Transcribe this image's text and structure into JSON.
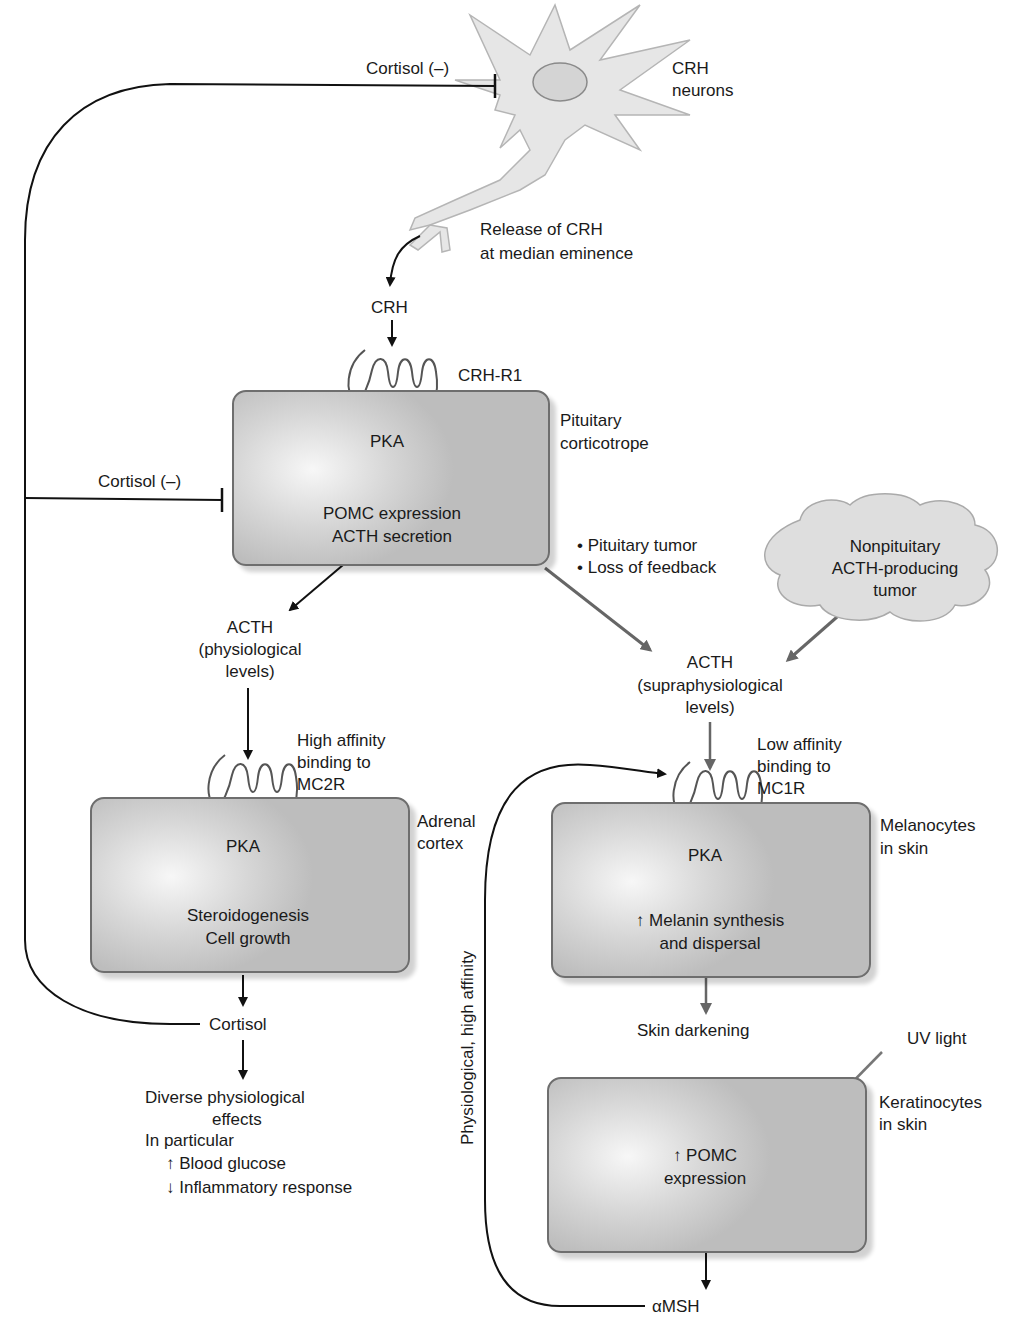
{
  "neuron": {
    "label_line1": "CRH",
    "label_line2": "neurons",
    "release_line1": "Release of CRH",
    "release_line2": "at median eminence"
  },
  "feedback": {
    "top_label": "Cortisol (–)",
    "mid_label": "Cortisol (–)"
  },
  "crh": {
    "label": "CRH",
    "receptor": "CRH-R1"
  },
  "pituitary": {
    "name_line1": "Pituitary",
    "name_line2": "corticotrope",
    "pka": "PKA",
    "line1": "POMC expression",
    "line2": "ACTH secretion"
  },
  "pathology": {
    "bullet1": "• Pituitary tumor",
    "bullet2": "• Loss of feedback"
  },
  "tumor_cloud": {
    "line1": "Nonpituitary",
    "line2": "ACTH-producing",
    "line3": "tumor"
  },
  "acth_phys": {
    "line1": "ACTH",
    "line2": "(physiological",
    "line3": "levels)"
  },
  "acth_supra": {
    "line1": "ACTH",
    "line2": "(supraphysiological",
    "line3": "levels)"
  },
  "adrenal": {
    "binding_line1": "High affinity",
    "binding_line2": "binding to",
    "binding_line3": "MC2R",
    "name_line1": "Adrenal",
    "name_line2": "cortex",
    "pka": "PKA",
    "line1": "Steroidogenesis",
    "line2": "Cell growth"
  },
  "cortisol": {
    "label": "Cortisol",
    "effects_line1": "Diverse physiological",
    "effects_line2": "effects",
    "effects_line3": "In particular",
    "effects_line4": "↑ Blood glucose",
    "effects_line5": "↓ Inflammatory response"
  },
  "melanocyte": {
    "binding_line1": "Low affinity",
    "binding_line2": "binding to",
    "binding_line3": "MC1R",
    "name_line1": "Melanocytes",
    "name_line2": "in skin",
    "pka": "PKA",
    "line1": "↑ Melanin synthesis",
    "line2": "and dispersal",
    "output": "Skin darkening"
  },
  "keratinocyte": {
    "uv": "UV light",
    "name_line1": "Keratinocytes",
    "name_line2": "in skin",
    "line1": "↑ POMC",
    "line2": "expression",
    "output": "αMSH"
  },
  "loop_label": "Physiological, high affinity"
}
